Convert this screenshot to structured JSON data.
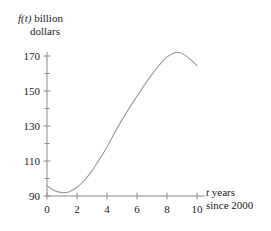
{
  "chart_data": {
    "type": "line",
    "title": "",
    "subtitle": "",
    "ylabel_line1_italic": "f(t)",
    "ylabel_line1_rest": " billion",
    "ylabel_line2": "dollars",
    "xlabel_line1_italic": "t",
    "xlabel_line1_rest": " years",
    "xlabel_line2": "since 2000",
    "xlabel": "t years since 2000",
    "ylabel": "f(t) billion dollars",
    "grid": false,
    "legend": "none",
    "xlim": [
      0,
      10
    ],
    "ylim": [
      90,
      178
    ],
    "xticks": [
      0,
      2,
      4,
      6,
      8,
      10
    ],
    "xtick_labels": [
      "0",
      "2",
      "4",
      "6",
      "8",
      "10"
    ],
    "yticks": [
      90,
      110,
      130,
      150,
      170
    ],
    "ytick_labels": [
      "90",
      "110",
      "130",
      "150",
      "170"
    ],
    "yticks_minor": [
      100,
      120,
      140,
      160
    ],
    "series": [
      {
        "name": "f(t)",
        "color": "#9a9a9a",
        "x": [
          0.0,
          0.5,
          1.0,
          1.2,
          1.5,
          2.0,
          2.5,
          3.0,
          3.5,
          4.0,
          4.5,
          5.0,
          5.5,
          6.0,
          6.5,
          7.0,
          7.5,
          8.0,
          8.5,
          8.7,
          9.0,
          9.5,
          10.0
        ],
        "y": [
          96.0,
          93.0,
          92.0,
          92.0,
          92.5,
          95.0,
          99.0,
          104.5,
          111.0,
          118.0,
          126.0,
          133.5,
          140.5,
          147.0,
          153.5,
          159.5,
          165.0,
          169.5,
          171.8,
          172.0,
          171.5,
          168.5,
          164.5
        ]
      }
    ]
  },
  "axes": {
    "y_axis_name": "value-axis",
    "x_axis_name": "time-axis",
    "axis_color": "#8c8c8c"
  }
}
